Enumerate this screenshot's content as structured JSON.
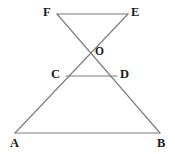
{
  "figure": {
    "background_color": "#ffffff",
    "line_color": "#7d7d7d",
    "label_color": "#1c1c1c",
    "points": {
      "A": {
        "label": "A",
        "x": 15,
        "y": 133,
        "label_x": 10,
        "label_y": 137
      },
      "B": {
        "label": "B",
        "x": 160,
        "y": 133,
        "label_x": 157,
        "label_y": 137
      },
      "C": {
        "label": "C",
        "x": 66,
        "y": 76,
        "label_x": 51,
        "label_y": 68
      },
      "D": {
        "label": "D",
        "x": 117,
        "y": 76,
        "label_x": 120,
        "label_y": 68
      },
      "E": {
        "label": "E",
        "x": 128,
        "y": 14,
        "label_x": 131,
        "label_y": 6
      },
      "F": {
        "label": "F",
        "x": 57,
        "y": 14,
        "label_x": 43,
        "label_y": 6
      },
      "O": {
        "label": "O",
        "x": 88,
        "y": 52,
        "label_x": 95,
        "label_y": 46
      }
    },
    "segments": [
      {
        "name": "segment-FE",
        "from": "F",
        "to": "E"
      },
      {
        "name": "segment-FB",
        "from": "F",
        "to": "B"
      },
      {
        "name": "segment-EA",
        "from": "E",
        "to": "A"
      },
      {
        "name": "segment-CD",
        "from": "C",
        "to": "D"
      },
      {
        "name": "segment-AB",
        "from": "A",
        "to": "B"
      }
    ]
  }
}
